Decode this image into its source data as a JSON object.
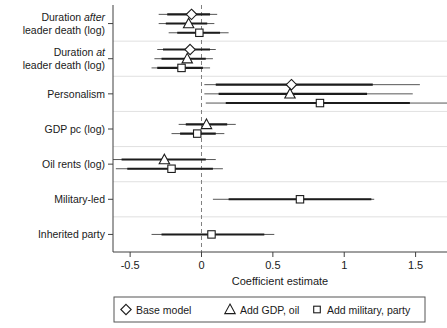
{
  "chart_data": {
    "type": "scatter",
    "plot_kind": "coefficient-plot-with-confidence-intervals",
    "title": "",
    "xlabel": "Coefficient estimate",
    "ylabel": "",
    "xlim": [
      -0.62,
      1.72
    ],
    "xticks": [
      -0.5,
      0,
      0.5,
      1,
      1.5
    ],
    "xticklabels": [
      "-0.5",
      "0",
      "0.5",
      "1",
      "1.5"
    ],
    "grid": "horizontal-separators-between-variable-groups",
    "reference_line": {
      "value": 0,
      "style": "dashed"
    },
    "legend": {
      "position": "below-axes",
      "entries": [
        {
          "label": "Base model",
          "marker": "diamond"
        },
        {
          "label": "Add GDP, oil",
          "marker": "triangle"
        },
        {
          "label": "Add military, party",
          "marker": "square"
        }
      ]
    },
    "categories": [
      "Duration after leader death (log)",
      "Duration at leader death (log)",
      "Personalism",
      "GDP pc (log)",
      "Oil rents (log)",
      "Military-led",
      "Inherited party"
    ],
    "category_labels_rich": [
      {
        "line1_pre": "Duration ",
        "line1_em": "after",
        "line1_post": "",
        "line2": "leader death (log)"
      },
      {
        "line1_pre": "Duration ",
        "line1_em": "at",
        "line1_post": "",
        "line2": "leader death (log)"
      },
      {
        "line1_pre": "Personalism",
        "line1_em": "",
        "line1_post": "",
        "line2": ""
      },
      {
        "line1_pre": "GDP pc (log)",
        "line1_em": "",
        "line1_post": "",
        "line2": ""
      },
      {
        "line1_pre": "Oil rents (log)",
        "line1_em": "",
        "line1_post": "",
        "line2": ""
      },
      {
        "line1_pre": "Military-led",
        "line1_em": "",
        "line1_post": "",
        "line2": ""
      },
      {
        "line1_pre": "Inherited party",
        "line1_em": "",
        "line1_post": "",
        "line2": ""
      }
    ],
    "series": [
      {
        "name": "Base model",
        "marker": "diamond",
        "points": [
          {
            "category": "Duration after leader death (log)",
            "estimate": -0.07,
            "ci_inner": [
              -0.24,
              0.06
            ],
            "ci_outer": [
              -0.3,
              0.11
            ]
          },
          {
            "category": "Duration at leader death (log)",
            "estimate": -0.08,
            "ci_inner": [
              -0.27,
              0.06
            ],
            "ci_outer": [
              -0.31,
              0.1
            ]
          },
          {
            "category": "Personalism",
            "estimate": 0.63,
            "ci_inner": [
              0.1,
              1.2
            ],
            "ci_outer": [
              0.02,
              1.53
            ]
          },
          {
            "category": "GDP pc (log)",
            "estimate": null,
            "ci_inner": null,
            "ci_outer": null
          },
          {
            "category": "Oil rents (log)",
            "estimate": null,
            "ci_inner": null,
            "ci_outer": null
          },
          {
            "category": "Military-led",
            "estimate": null,
            "ci_inner": null,
            "ci_outer": null
          },
          {
            "category": "Inherited party",
            "estimate": null,
            "ci_inner": null,
            "ci_outer": null
          }
        ]
      },
      {
        "name": "Add GDP, oil",
        "marker": "triangle",
        "points": [
          {
            "category": "Duration after leader death (log)",
            "estimate": -0.09,
            "ci_inner": [
              -0.25,
              0.04
            ],
            "ci_outer": [
              -0.3,
              0.09
            ]
          },
          {
            "category": "Duration at leader death (log)",
            "estimate": -0.1,
            "ci_inner": [
              -0.28,
              0.03
            ],
            "ci_outer": [
              -0.33,
              0.08
            ]
          },
          {
            "category": "Personalism",
            "estimate": 0.62,
            "ci_inner": [
              0.12,
              1.16
            ],
            "ci_outer": [
              0.02,
              1.48
            ]
          },
          {
            "category": "GDP pc (log)",
            "estimate": 0.035,
            "ci_inner": [
              -0.11,
              0.18
            ],
            "ci_outer": [
              -0.16,
              0.24
            ]
          },
          {
            "category": "Oil rents (log)",
            "estimate": -0.26,
            "ci_inner": [
              -0.56,
              0.03
            ],
            "ci_outer": [
              -0.62,
              0.1
            ]
          },
          {
            "category": "Military-led",
            "estimate": null,
            "ci_inner": null,
            "ci_outer": null
          },
          {
            "category": "Inherited party",
            "estimate": null,
            "ci_inner": null,
            "ci_outer": null
          }
        ]
      },
      {
        "name": "Add military, party",
        "marker": "square",
        "points": [
          {
            "category": "Duration after leader death (log)",
            "estimate": -0.015,
            "ci_inner": [
              -0.17,
              0.13
            ],
            "ci_outer": [
              -0.23,
              0.19
            ]
          },
          {
            "category": "Duration at leader death (log)",
            "estimate": -0.14,
            "ci_inner": [
              -0.31,
              0.01
            ],
            "ci_outer": [
              -0.35,
              0.06
            ]
          },
          {
            "category": "Personalism",
            "estimate": 0.83,
            "ci_inner": [
              0.17,
              1.46
            ],
            "ci_outer": [
              0.03,
              1.72
            ]
          },
          {
            "category": "GDP pc (log)",
            "estimate": -0.03,
            "ci_inner": [
              -0.15,
              0.1
            ],
            "ci_outer": [
              -0.21,
              0.16
            ]
          },
          {
            "category": "Oil rents (log)",
            "estimate": -0.21,
            "ci_inner": [
              -0.52,
              0.08
            ],
            "ci_outer": [
              -0.6,
              0.15
            ]
          },
          {
            "category": "Military-led",
            "estimate": 0.69,
            "ci_inner": [
              0.19,
              1.19
            ],
            "ci_outer": [
              0.08,
              1.21
            ]
          },
          {
            "category": "Inherited party",
            "estimate": 0.07,
            "ci_inner": [
              -0.28,
              0.44
            ],
            "ci_outer": [
              -0.35,
              0.51
            ]
          }
        ]
      }
    ]
  },
  "colors": {
    "marker_fill": "#ffffff",
    "marker_stroke": "#1c1c1c",
    "ci_inner": "#1c1c1c",
    "ci_outer": "#444444",
    "axis": "#404040",
    "grid": "#d8d8d8",
    "zero_line": "#808080"
  }
}
